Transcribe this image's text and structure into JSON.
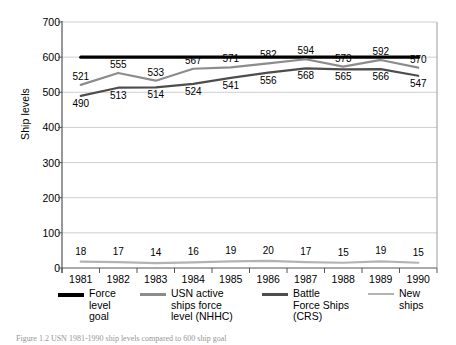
{
  "chart_data": {
    "type": "line",
    "title": "",
    "xlabel": "",
    "ylabel": "Ship levels",
    "ylim": [
      0,
      700
    ],
    "ytick_step": 100,
    "yticks": [
      "0",
      "100",
      "200",
      "300",
      "400",
      "500",
      "600",
      "700"
    ],
    "grid": true,
    "legend_position": "bottom",
    "categories": [
      "1981",
      "1982",
      "1983",
      "1984",
      "1985",
      "1986",
      "1987",
      "1988",
      "1989",
      "1990"
    ],
    "series": [
      {
        "name": "Force level goal",
        "color": "#000000",
        "width": 3.2,
        "values": [
          600,
          600,
          600,
          600,
          600,
          600,
          600,
          600,
          600,
          600
        ],
        "show_labels": false
      },
      {
        "name": "USN active ships force level (NHHC)",
        "color": "#8c8c8c",
        "width": 2.2,
        "values": [
          521,
          555,
          533,
          567,
          571,
          582,
          594,
          573,
          592,
          570
        ],
        "show_labels": true
      },
      {
        "name": "Battle Force Ships (CRS)",
        "color": "#4d4d4d",
        "width": 2.2,
        "values": [
          490,
          513,
          514,
          524,
          541,
          556,
          568,
          565,
          566,
          547
        ],
        "show_labels": true
      },
      {
        "name": "New ships",
        "color": "#b3b3b3",
        "width": 2.2,
        "values": [
          18,
          17,
          14,
          16,
          19,
          20,
          17,
          15,
          19,
          15
        ],
        "show_labels": true
      }
    ]
  },
  "legend": {
    "items": [
      {
        "label": "Force\nlevel\ngoal",
        "color": "#000000",
        "thickness": 4
      },
      {
        "label": "USN active\nships force\nlevel (NHHC)",
        "color": "#8c8c8c",
        "thickness": 2.5
      },
      {
        "label": "Battle\nForce Ships\n(CRS)",
        "color": "#4d4d4d",
        "thickness": 3
      },
      {
        "label": "New\nships",
        "color": "#b3b3b3",
        "thickness": 2
      }
    ]
  },
  "caption": {
    "text": "Figure 1.2 USN 1981-1990 ship levels compared to 600 ship goal"
  }
}
